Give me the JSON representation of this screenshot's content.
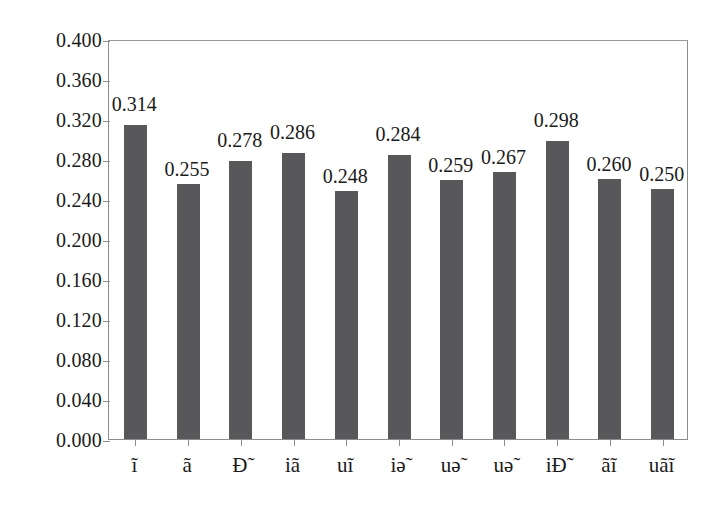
{
  "chart_data": {
    "type": "bar",
    "title": "",
    "subtitle": "",
    "xlabel": "",
    "ylabel": "",
    "categories": [
      "ĩ",
      "ã",
      "Ð̃",
      "iã",
      "uĩ",
      "iə̃",
      "uə̃",
      "uə̃",
      "iÐ̃",
      "ãĩ",
      "uãĩ"
    ],
    "values": [
      0.314,
      0.255,
      0.278,
      0.286,
      0.248,
      0.284,
      0.259,
      0.267,
      0.298,
      0.26,
      0.25
    ],
    "data_labels": [
      "0.314",
      "0.255",
      "0.278",
      "0.286",
      "0.248",
      "0.284",
      "0.259",
      "0.267",
      "0.298",
      "0.260",
      "0.250"
    ],
    "ylim": [
      0.0,
      0.4
    ],
    "ytick_labels": [
      "0.400",
      "0.360",
      "0.320",
      "0.280",
      "0.240",
      "0.200",
      "0.160",
      "0.120",
      "0.080",
      "0.040",
      "0.000"
    ],
    "ytick_values": [
      0.4,
      0.36,
      0.32,
      0.28,
      0.24,
      0.2,
      0.16,
      0.12,
      0.08,
      0.04,
      0.0
    ],
    "grid": false,
    "legend": null,
    "legend_position": "none",
    "annotations": [],
    "colors": {
      "bar_fill": "#58585a",
      "axis_line": "#8d8d8d",
      "text": "#1a1a1a",
      "background": "#ffffff"
    }
  }
}
